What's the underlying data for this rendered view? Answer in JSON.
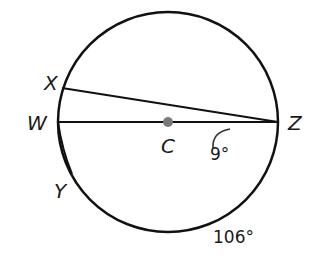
{
  "diagram": {
    "circle": {
      "cx": 168,
      "cy": 122,
      "r": 110,
      "stroke": "#111111"
    },
    "center": {
      "label": "C",
      "x": 168,
      "y": 122,
      "color": "#7a7a7a"
    },
    "points": {
      "W": {
        "label": "W",
        "x": 58,
        "y": 122
      },
      "X": {
        "label": "X",
        "x": 62,
        "y": 88
      },
      "Y": {
        "label": "Y",
        "x": 72,
        "y": 174
      },
      "Z": {
        "label": "Z",
        "x": 278,
        "y": 122
      }
    },
    "segments": [
      {
        "from": "W",
        "to": "Z",
        "name": "diameter-WZ"
      },
      {
        "from": "X",
        "to": "Z",
        "name": "chord-XZ"
      },
      {
        "from": "W",
        "to": "Y",
        "name": "chord-WY"
      }
    ],
    "angle_label": "9°",
    "arc_label": "106°"
  }
}
